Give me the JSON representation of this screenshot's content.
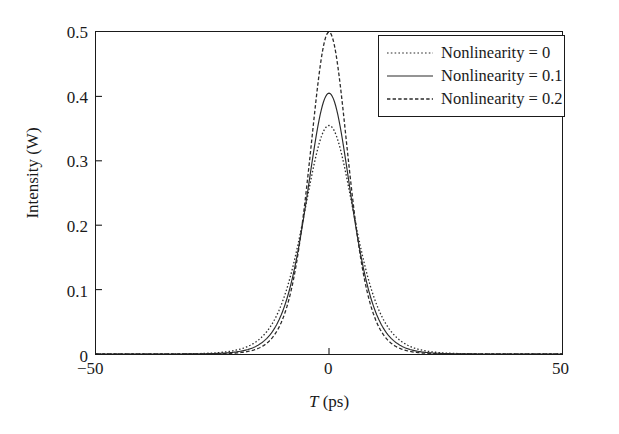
{
  "chart_data": {
    "type": "line",
    "title": "",
    "xlabel": "T (ps)",
    "ylabel": "Intensity (W)",
    "xlim": [
      -50,
      50
    ],
    "ylim": [
      0,
      0.5
    ],
    "xticks": [
      -50,
      0,
      50
    ],
    "xtick_labels": [
      "−50",
      "0",
      "50"
    ],
    "yticks": [
      0,
      0.1,
      0.2,
      0.3,
      0.4,
      0.5
    ],
    "ytick_labels": [
      "0",
      "0.1",
      "0.2",
      "0.3",
      "0.4",
      "0.5"
    ],
    "grid": false,
    "legend_position": "upper right",
    "series": [
      {
        "name": "Nonlinearity = 0",
        "style": "dotted",
        "color": "#2b2b2b",
        "peak": 0.355,
        "center": 0,
        "halfwidth_ps": 7.3,
        "x": [
          -50,
          -45,
          -40,
          -35,
          -30,
          -26,
          -22,
          -19,
          -17,
          -15,
          -13,
          -11,
          -9,
          -7.5,
          -6,
          -4.5,
          -3,
          -1.5,
          0,
          1.5,
          3,
          4.5,
          6,
          7.5,
          9,
          11,
          13,
          15,
          17,
          19,
          22,
          26,
          30,
          35,
          40,
          45,
          50
        ],
        "y": [
          0.0,
          0.0,
          0.0,
          0.0,
          0.001,
          0.002,
          0.005,
          0.011,
          0.018,
          0.03,
          0.049,
          0.079,
          0.122,
          0.162,
          0.206,
          0.251,
          0.293,
          0.329,
          0.355,
          0.329,
          0.293,
          0.251,
          0.206,
          0.162,
          0.122,
          0.079,
          0.049,
          0.03,
          0.018,
          0.011,
          0.005,
          0.002,
          0.001,
          0.0,
          0.0,
          0.0,
          0.0
        ]
      },
      {
        "name": "Nonlinearity = 0.1",
        "style": "solid",
        "color": "#2b2b2b",
        "peak": 0.405,
        "center": 0,
        "halfwidth_ps": 6.4,
        "x": [
          -50,
          -45,
          -40,
          -35,
          -30,
          -26,
          -22,
          -19,
          -17,
          -15,
          -13,
          -11,
          -9,
          -7.5,
          -6,
          -4.5,
          -3,
          -1.5,
          0,
          1.5,
          3,
          4.5,
          6,
          7.5,
          9,
          11,
          13,
          15,
          17,
          19,
          22,
          26,
          30,
          35,
          40,
          45,
          50
        ],
        "y": [
          0.0,
          0.0,
          0.0,
          0.0,
          0.0,
          0.001,
          0.003,
          0.007,
          0.012,
          0.021,
          0.037,
          0.063,
          0.105,
          0.146,
          0.196,
          0.25,
          0.302,
          0.35,
          0.405,
          0.35,
          0.302,
          0.25,
          0.196,
          0.146,
          0.105,
          0.063,
          0.037,
          0.021,
          0.012,
          0.007,
          0.003,
          0.001,
          0.0,
          0.0,
          0.0,
          0.0,
          0.0
        ]
      },
      {
        "name": "Nonlinearity = 0.2",
        "style": "dashed",
        "color": "#2b2b2b",
        "peak": 0.5,
        "center": 0,
        "halfwidth_ps": 5.6,
        "x": [
          -50,
          -45,
          -40,
          -35,
          -30,
          -26,
          -22,
          -19,
          -17,
          -15,
          -13,
          -11,
          -9,
          -7.5,
          -6,
          -4.5,
          -3,
          -1.5,
          0,
          1.5,
          3,
          4.5,
          6,
          7.5,
          9,
          11,
          13,
          15,
          17,
          19,
          22,
          26,
          30,
          35,
          40,
          45,
          50
        ],
        "y": [
          0.0,
          0.0,
          0.0,
          0.0,
          0.0,
          0.0,
          0.001,
          0.003,
          0.006,
          0.012,
          0.023,
          0.044,
          0.082,
          0.125,
          0.182,
          0.25,
          0.32,
          0.42,
          0.5,
          0.42,
          0.32,
          0.25,
          0.182,
          0.125,
          0.082,
          0.044,
          0.023,
          0.012,
          0.006,
          0.003,
          0.001,
          0.0,
          0.0,
          0.0,
          0.0,
          0.0,
          0.0
        ]
      }
    ]
  },
  "axes": {
    "ylabel": "Intensity (W)",
    "xlabel_var": "T",
    "xlabel_unit": " (ps)",
    "ytick_labels": [
      "0.5",
      "0.4",
      "0.3",
      "0.2",
      "0.1",
      "0"
    ],
    "xtick_labels": [
      "−50",
      "0",
      "50"
    ]
  },
  "legend": {
    "entries": [
      {
        "label": "Nonlinearity = 0"
      },
      {
        "label": "Nonlinearity = 0.1"
      },
      {
        "label": "Nonlinearity = 0.2"
      }
    ]
  }
}
